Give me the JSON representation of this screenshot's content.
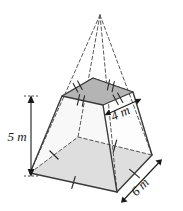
{
  "figure": {
    "shape_name": "square-pyramid-frustum",
    "colors": {
      "base_fill": "#c6c6c6",
      "top_fill": "#b4b4b4",
      "lateral_fill": "#ffffff",
      "outline": "#3a3a3a",
      "hidden_edge": "#555555",
      "apex_guide": "#5a5a5a",
      "label_text": "#1a1a1a",
      "background": "#ffffff"
    },
    "labels": {
      "height": "5 m",
      "top_edge": "4 m",
      "base_edge": "6 m"
    },
    "geometry": {
      "apex": [
        100,
        15
      ],
      "top_face": {
        "left": [
          62,
          96
        ],
        "back": [
          93,
          78
        ],
        "right": [
          133,
          92
        ],
        "front": [
          103,
          105
        ]
      },
      "base_face": {
        "left": [
          30,
          173
        ],
        "back": [
          78,
          137
        ],
        "right": [
          152,
          155
        ],
        "front": [
          117,
          192
        ]
      }
    },
    "tick_marks": {
      "top_face_ticks": "double",
      "base_face_ticks": "single"
    },
    "arrows": {
      "height_arrow": "vertical-double-headed",
      "top_edge_arrow": "double-headed",
      "base_edge_arrow": "double-headed"
    }
  }
}
